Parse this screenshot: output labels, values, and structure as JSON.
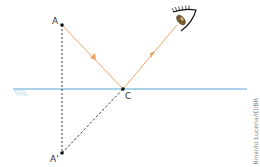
{
  "diagram": {
    "points": {
      "A": {
        "label": "A",
        "x": 62,
        "y": 25
      },
      "C": {
        "label": "C",
        "x": 123,
        "y": 89
      },
      "A_prime": {
        "label": "A'",
        "x": 62,
        "y": 153
      }
    },
    "mirror": {
      "x1": 13,
      "x2": 247,
      "y": 89
    },
    "eye": {
      "x": 182,
      "y": 16
    },
    "colors": {
      "ray": "#f2a46a",
      "mirror": "#8cc3e6",
      "hatch": "#9bc8e4",
      "dashed": "#222222",
      "point": "#111111",
      "eye_lid": "#111111",
      "eye_iris": "#7a5a2e"
    },
    "credit": "Rinaldo Lucena/ID/BR"
  }
}
